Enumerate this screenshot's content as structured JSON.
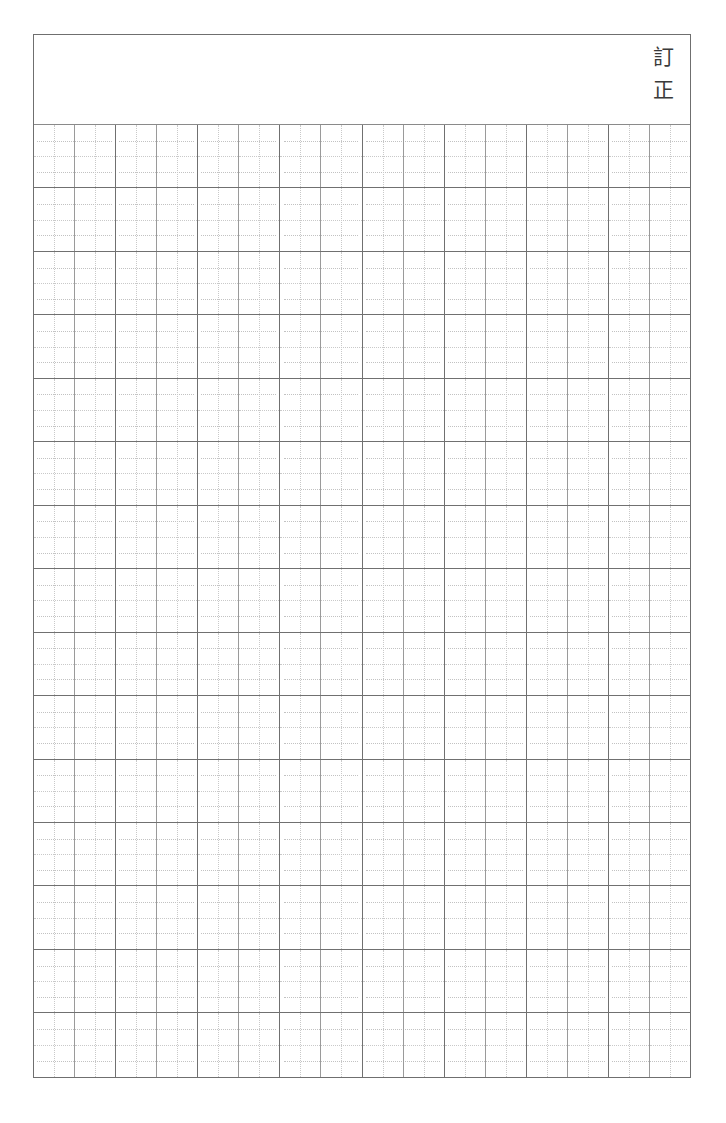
{
  "document": {
    "kind": "japanese-manuscript-paper",
    "sheet_background": "#ffffff",
    "frame_color": "#6f6f6f",
    "rule_color": "#707070",
    "cell_rule_color": "#9a9a9a",
    "dotted_guide_color": "#c9c9c9"
  },
  "header": {
    "label_chars": [
      "訂",
      "正"
    ],
    "label_text": "訂正",
    "char_top": "訂",
    "char_bottom": "正",
    "body_text": ""
  },
  "grid": {
    "rows": 15,
    "column_blocks": 8,
    "cells_per_block": 2,
    "total_columns": 16,
    "total_cells": 240,
    "cell_contents": [
      [
        "",
        "",
        "",
        "",
        "",
        "",
        "",
        "",
        "",
        "",
        "",
        "",
        "",
        "",
        "",
        ""
      ],
      [
        "",
        "",
        "",
        "",
        "",
        "",
        "",
        "",
        "",
        "",
        "",
        "",
        "",
        "",
        "",
        ""
      ],
      [
        "",
        "",
        "",
        "",
        "",
        "",
        "",
        "",
        "",
        "",
        "",
        "",
        "",
        "",
        "",
        ""
      ],
      [
        "",
        "",
        "",
        "",
        "",
        "",
        "",
        "",
        "",
        "",
        "",
        "",
        "",
        "",
        "",
        ""
      ],
      [
        "",
        "",
        "",
        "",
        "",
        "",
        "",
        "",
        "",
        "",
        "",
        "",
        "",
        "",
        "",
        ""
      ],
      [
        "",
        "",
        "",
        "",
        "",
        "",
        "",
        "",
        "",
        "",
        "",
        "",
        "",
        "",
        "",
        ""
      ],
      [
        "",
        "",
        "",
        "",
        "",
        "",
        "",
        "",
        "",
        "",
        "",
        "",
        "",
        "",
        "",
        ""
      ],
      [
        "",
        "",
        "",
        "",
        "",
        "",
        "",
        "",
        "",
        "",
        "",
        "",
        "",
        "",
        "",
        ""
      ],
      [
        "",
        "",
        "",
        "",
        "",
        "",
        "",
        "",
        "",
        "",
        "",
        "",
        "",
        "",
        "",
        ""
      ],
      [
        "",
        "",
        "",
        "",
        "",
        "",
        "",
        "",
        "",
        "",
        "",
        "",
        "",
        "",
        "",
        ""
      ],
      [
        "",
        "",
        "",
        "",
        "",
        "",
        "",
        "",
        "",
        "",
        "",
        "",
        "",
        "",
        "",
        ""
      ],
      [
        "",
        "",
        "",
        "",
        "",
        "",
        "",
        "",
        "",
        "",
        "",
        "",
        "",
        "",
        "",
        ""
      ],
      [
        "",
        "",
        "",
        "",
        "",
        "",
        "",
        "",
        "",
        "",
        "",
        "",
        "",
        "",
        "",
        ""
      ],
      [
        "",
        "",
        "",
        "",
        "",
        "",
        "",
        "",
        "",
        "",
        "",
        "",
        "",
        "",
        "",
        ""
      ],
      [
        "",
        "",
        "",
        "",
        "",
        "",
        "",
        "",
        "",
        "",
        "",
        "",
        "",
        "",
        "",
        ""
      ]
    ]
  }
}
